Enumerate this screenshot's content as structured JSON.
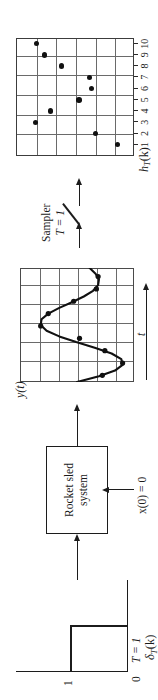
{
  "figure": {
    "orientation": "rotated-90-ccw"
  },
  "delta_panel": {
    "signal_label": "δ",
    "signal_sub": "T",
    "signal_arg": "(k)",
    "signal_label_full": "δT(k)",
    "amplitude_label": "1",
    "origin_label": "0",
    "period_label": "T = 1",
    "pulse_height": 1,
    "pulse_width": 1
  },
  "block_panel": {
    "block_line1": "Rocket sled",
    "block_line2": "system",
    "initial_condition": "x(0) = 0",
    "input_arrow": "arrow-right-icon",
    "output_arrow": "arrow-right-icon",
    "ic_arrow": "arrow-up-icon"
  },
  "yt_panel": {
    "ylabel": "y(t)",
    "xlabel": "t",
    "axis_arrow": "arrow-right-icon",
    "grid_columns": 6,
    "grid_rows": 6
  },
  "sampler_panel": {
    "line1": "Sampler",
    "line2": "T = 1",
    "switch_icon": "sampler-switch-icon",
    "in_arrow": "arrow-right-icon",
    "out_arrow": "arrow-right-icon"
  },
  "hk_panel": {
    "ylabel": "h",
    "ylabel_sub": "T",
    "ylabel_arg": "(k)",
    "ylabel_full": "hT(k)",
    "grid_columns": 6,
    "grid_rows": 6,
    "tick_labels": [
      "1",
      "2",
      "3",
      "4",
      "5",
      "6",
      "7",
      "8",
      "9",
      "10"
    ]
  },
  "chart_data": [
    {
      "type": "line",
      "name": "yt-response",
      "title": "y(t)",
      "xlabel": "t",
      "ylabel": "y(t)",
      "grid": true,
      "xlim": [
        0,
        6
      ],
      "ylim": [
        -1.35,
        1.35
      ],
      "x": [
        0.0,
        0.3,
        0.6,
        0.9,
        1.2,
        1.5,
        1.8,
        2.1,
        2.4,
        2.7,
        3.0,
        3.3,
        3.6,
        3.9,
        4.2,
        4.5,
        4.8,
        5.1,
        5.4,
        5.7,
        6.0
      ],
      "y": [
        0.0,
        -0.52,
        -0.9,
        -1.08,
        -1.05,
        -0.82,
        -0.42,
        0.02,
        0.42,
        0.72,
        0.86,
        0.84,
        0.68,
        0.42,
        0.12,
        -0.16,
        -0.38,
        -0.5,
        -0.52,
        -0.44,
        -0.3
      ],
      "markers_x": [
        0.35,
        1.0,
        1.65,
        2.3,
        2.95,
        3.6,
        4.25,
        4.9,
        5.55
      ],
      "markers_y": [
        -0.6,
        -1.08,
        -0.66,
        -0.06,
        0.86,
        0.68,
        0.08,
        -0.46,
        -0.5
      ]
    },
    {
      "type": "scatter",
      "name": "hk-samples",
      "title": "hT(k)",
      "xlabel": "k",
      "ylabel": "hT(k)",
      "grid": true,
      "xlim": [
        0,
        10.5
      ],
      "ylim": [
        -1.2,
        1.2
      ],
      "categories": [
        "1",
        "2",
        "3",
        "4",
        "5",
        "6",
        "7",
        "8",
        "9",
        "10"
      ],
      "x": [
        1,
        2,
        3,
        4,
        5,
        6,
        7,
        8,
        9,
        10
      ],
      "values": [
        -0.86,
        -0.42,
        0.8,
        0.5,
        -0.08,
        -0.34,
        -0.3,
        0.28,
        0.62,
        0.78
      ]
    }
  ]
}
